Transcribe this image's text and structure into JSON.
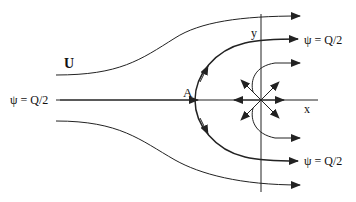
{
  "diagram": {
    "labels": {
      "uniform_flow": "U",
      "stagnation_point": "A",
      "x_axis": "x",
      "y_axis": "y",
      "dividing_streamline_left": "ψ = Q/2",
      "dividing_streamline_upper": "ψ = Q/2",
      "dividing_streamline_lower": "ψ = Q/2"
    },
    "colors": {
      "stroke": "#222222",
      "background": "#ffffff"
    }
  }
}
